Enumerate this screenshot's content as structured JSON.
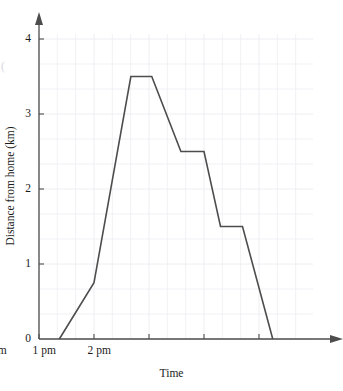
{
  "chart_data": {
    "type": "line",
    "title": "",
    "xlabel": "Time",
    "ylabel": "Distance from home (km)",
    "xlim": [
      10,
      14.7
    ],
    "ylim": [
      0,
      4.2
    ],
    "grid": true,
    "legend": "none",
    "x_tick_labels": [
      "10 am",
      "11 am",
      "12 pm",
      "1 pm",
      "2 pm"
    ],
    "x_tick_values": [
      10,
      11,
      12,
      13,
      14
    ],
    "y_tick_labels": [
      "0",
      "1",
      "2",
      "3",
      "4"
    ],
    "y_tick_values": [
      0,
      1,
      2,
      3,
      4
    ],
    "x_minor_per_major": 3,
    "y_minor_per_major": 3,
    "series": [
      {
        "name": "Distance from home",
        "color": "#4d4d4d",
        "x": [
          10.37,
          11.0,
          11.67,
          12.05,
          12.58,
          13.0,
          13.3,
          13.7,
          14.25
        ],
        "y": [
          0,
          0.75,
          3.5,
          3.5,
          2.5,
          2.5,
          1.5,
          1.5,
          0
        ],
        "x_labels": [
          "10:22 am",
          "11:00 am",
          "11:40 am",
          "12:03 pm",
          "12:35 pm",
          "1:00 pm",
          "1:18 pm",
          "1:42 pm",
          "2:15 pm"
        ]
      }
    ]
  },
  "axis_style": {
    "axis_color": "#4d4d4d",
    "grid_color": "#eeeef2",
    "line_color": "#4d4d4d",
    "text_color": "#1a1a1a"
  },
  "artifact": {
    "edge_glyph": "("
  }
}
